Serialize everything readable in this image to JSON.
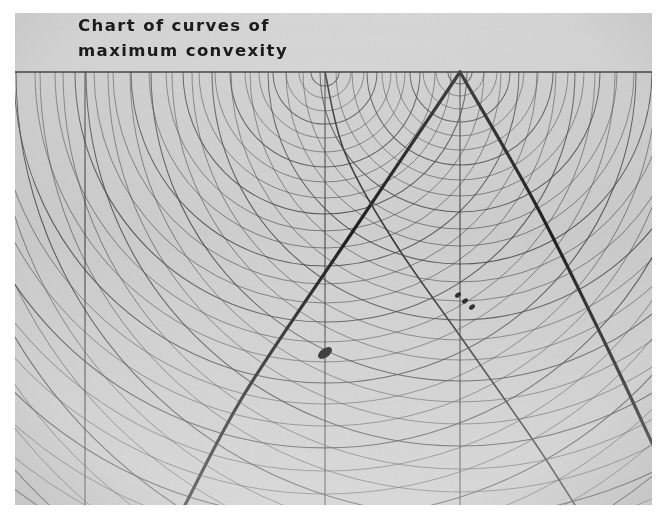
{
  "figure": {
    "kind": "photographic-plate",
    "title_lines": [
      "Chart of curves of",
      "maximum convexity"
    ],
    "plate": {
      "left": 15,
      "top": 13,
      "width": 637,
      "height": 492,
      "paper_color": "#ffffff",
      "emulsion_color": "#cfcfcf",
      "header_band_color": "#d2d2d2",
      "ink_color": "#1b1b1b"
    }
  },
  "chart_data": {
    "type": "line",
    "title": "Chart of curves of maximum convexity",
    "subtitle": "",
    "xlabel": "",
    "ylabel": "",
    "grid": true,
    "legend_position": "none",
    "xlim": [
      0,
      637
    ],
    "ylim": [
      0,
      492
    ],
    "datum_line": {
      "y": 59,
      "x_start": 0,
      "x_end": 637,
      "label": "baseline"
    },
    "header_band": {
      "y_top": 0,
      "y_bottom": 59,
      "fill": "#d2d2d2"
    },
    "vertical_gridlines": [
      {
        "name": "gridline-1",
        "x": 70
      },
      {
        "name": "gridline-2",
        "x": 310
      },
      {
        "name": "gridline-3",
        "x": 445
      }
    ],
    "arc_families": [
      {
        "name": "family-left",
        "center": [
          310,
          59
        ],
        "radii": [
          14,
          26,
          39,
          52,
          66,
          80,
          95,
          110,
          126,
          142,
          159,
          176,
          194,
          212,
          231,
          250,
          270,
          290,
          311,
          332,
          354,
          376,
          399,
          422,
          446,
          470,
          495,
          520,
          546,
          572,
          599,
          626,
          654,
          682,
          711,
          740
        ],
        "sweep": "downward",
        "stroke": "#3a3a3a"
      },
      {
        "name": "family-right",
        "center": [
          445,
          59
        ],
        "radii": [
          12,
          24,
          37,
          50,
          64,
          78,
          93,
          108,
          124,
          140,
          157,
          174,
          192,
          210,
          229,
          248,
          268,
          288,
          309,
          330,
          352,
          374,
          397,
          420,
          444,
          468,
          493,
          518,
          544,
          570,
          597,
          624,
          652,
          680
        ],
        "sweep": "downward",
        "stroke": "#3a3a3a"
      }
    ],
    "caustics": [
      {
        "name": "caustic-left-limb",
        "points": [
          [
            445,
            59
          ],
          [
            330,
            230
          ],
          [
            230,
            380
          ],
          [
            170,
            492
          ]
        ],
        "stroke": "#141414",
        "width": 3.2
      },
      {
        "name": "caustic-right-limb",
        "points": [
          [
            445,
            59
          ],
          [
            520,
            190
          ],
          [
            590,
            330
          ],
          [
            637,
            430
          ]
        ],
        "stroke": "#141414",
        "width": 3.2
      },
      {
        "name": "descending-curve-from-gridline-2",
        "points": [
          [
            310,
            59
          ],
          [
            330,
            140
          ],
          [
            380,
            230
          ],
          [
            450,
            330
          ],
          [
            520,
            430
          ],
          [
            560,
            492
          ]
        ],
        "stroke": "#2a2a2a",
        "width": 1.6
      }
    ],
    "crossing_points": [
      {
        "name": "caustic-crossing-x",
        "x": 360,
        "y": 172
      }
    ],
    "markers": [
      {
        "name": "marker-blob",
        "x": 310,
        "y": 340,
        "w": 16,
        "h": 9,
        "angle": -35,
        "fill": "#101010"
      },
      {
        "name": "marker-dashes",
        "x": 443,
        "y": 282,
        "count": 3,
        "fill": "#101010"
      }
    ]
  },
  "annotations": {
    "title_block_name": "chart-title-block"
  }
}
